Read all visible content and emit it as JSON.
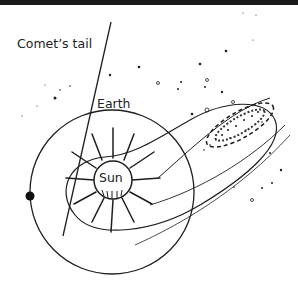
{
  "diagram": {
    "type": "comet-orbit-illustration",
    "labels": {
      "comet_tail": "Comet’s tail",
      "earth": "Earth",
      "sun": "Sun"
    },
    "colors": {
      "ink": "#1e1e1e",
      "background": "#ffffff",
      "top_bar": "#1a1a1a"
    },
    "elements": [
      {
        "name": "sun",
        "shape": "circle with radiating rays"
      },
      {
        "name": "earth-orbit",
        "shape": "circle"
      },
      {
        "name": "earth",
        "shape": "filled dot on orbit"
      },
      {
        "name": "comet-orbit",
        "shape": "elongated ellipse around sun"
      },
      {
        "name": "comet-head",
        "shape": "stippled ellipse"
      },
      {
        "name": "comet-tail",
        "shape": "straight line"
      },
      {
        "name": "stars",
        "shape": "scattered dots"
      }
    ]
  }
}
